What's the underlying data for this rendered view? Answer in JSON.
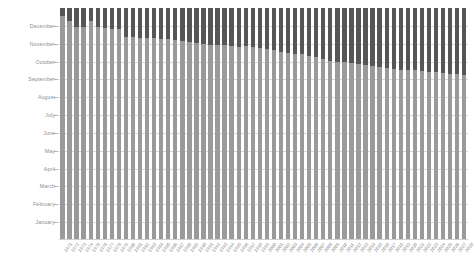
{
  "chart_data": {
    "type": "bar",
    "stacked": true,
    "title": "",
    "subtitle": "",
    "xlabel": "",
    "ylabel": "",
    "grid": true,
    "legend_position": "none",
    "ytick_labels": [
      "January",
      "February",
      "March",
      "April",
      "May",
      "June",
      "July",
      "August",
      "September",
      "October",
      "November",
      "December"
    ],
    "ylim_months": [
      0,
      13
    ],
    "colors": {
      "lower_segment": "#9a9a9a",
      "upper_segment": "#565656",
      "gridline": "#d8d8d8",
      "tick_text": "#8d8d8d",
      "background": "#ffffff"
    },
    "series": [
      {
        "name": "lower-segment",
        "color": "#9a9a9a"
      },
      {
        "name": "upper-segment",
        "color": "#565656"
      }
    ],
    "categories": [
      "1971",
      "1972",
      "1973",
      "1974",
      "1975",
      "1976",
      "1977",
      "1978",
      "1979",
      "1980",
      "1981",
      "1982",
      "1983",
      "1984",
      "1985",
      "1986",
      "1987",
      "1988",
      "1989",
      "1990",
      "1991",
      "1992",
      "1993",
      "1994",
      "1995",
      "1996",
      "1997",
      "1998",
      "1999",
      "2000",
      "2001",
      "2002",
      "2003",
      "2004",
      "2005",
      "2006",
      "2007",
      "2008",
      "2009",
      "2010",
      "2011",
      "2012",
      "2013",
      "2014",
      "2015",
      "2016",
      "2017",
      "2018",
      "2019",
      "2020",
      "2021",
      "2022",
      "2023",
      "2024",
      "2025",
      "2026",
      "2027",
      "2028"
    ],
    "lower_values": [
      12.55,
      12.3,
      11.95,
      11.95,
      12.3,
      11.95,
      11.9,
      11.85,
      11.8,
      11.4,
      11.35,
      11.3,
      11.3,
      11.3,
      11.25,
      11.25,
      11.2,
      11.15,
      11.1,
      11.05,
      11.0,
      10.95,
      10.9,
      10.9,
      10.85,
      10.8,
      10.85,
      10.8,
      10.75,
      10.7,
      10.65,
      10.55,
      10.5,
      10.45,
      10.4,
      10.3,
      10.25,
      10.15,
      10.05,
      10.0,
      9.95,
      9.9,
      9.85,
      9.8,
      9.75,
      9.7,
      9.65,
      9.6,
      9.55,
      9.5,
      9.5,
      9.45,
      9.4,
      9.4,
      9.35,
      9.3,
      9.3,
      9.25
    ],
    "total_values": [
      13,
      13,
      13,
      13,
      13,
      13,
      13,
      13,
      13,
      13,
      13,
      13,
      13,
      13,
      13,
      13,
      13,
      13,
      13,
      13,
      13,
      13,
      13,
      13,
      13,
      13,
      13,
      13,
      13,
      13,
      13,
      13,
      13,
      13,
      13,
      13,
      13,
      13,
      13,
      13,
      13,
      13,
      13,
      13,
      13,
      13,
      13,
      13,
      13,
      13,
      13,
      13,
      13,
      13,
      13,
      13,
      13,
      13
    ]
  }
}
